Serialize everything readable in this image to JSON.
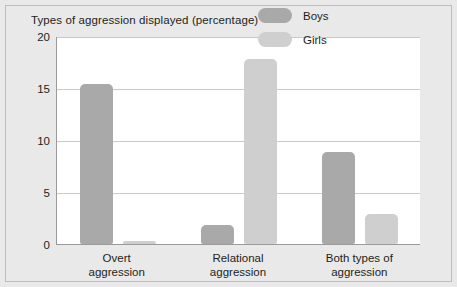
{
  "chart_data": {
    "type": "bar",
    "title": "Types of aggression displayed (percentage)",
    "xlabel": "",
    "ylabel": "",
    "ylim": [
      0,
      20
    ],
    "yticks": [
      "0",
      "5",
      "10",
      "15",
      "20"
    ],
    "grid": true,
    "legend_position": "top-right",
    "categories": [
      "Overt\naggression",
      "Relational\naggression",
      "Both types of\naggression"
    ],
    "series": [
      {
        "name": "Boys",
        "color": "#a9a9a9",
        "values": [
          15.4,
          1.8,
          8.8
        ]
      },
      {
        "name": "Girls",
        "color": "#cfcfcf",
        "values": [
          0.3,
          17.8,
          2.9
        ]
      }
    ]
  },
  "legend": {
    "items": [
      {
        "label": "Boys"
      },
      {
        "label": "Girls"
      }
    ]
  }
}
